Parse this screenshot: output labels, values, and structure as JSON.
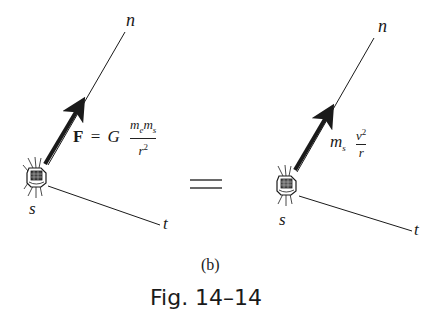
{
  "figure": {
    "panel_label": "(b)",
    "caption": "Fig. 14–14",
    "equals_sign": "="
  },
  "left_diagram": {
    "axis_n_label": "n",
    "axis_t_label": "t",
    "satellite_label": "s",
    "force_label": "F",
    "equation_eq": "=",
    "equation_G": "G",
    "numerator_m1": "m",
    "numerator_m1_sub": "e",
    "numerator_m2": "m",
    "numerator_m2_sub": "s",
    "denominator": "r",
    "denominator_exp": "2"
  },
  "right_diagram": {
    "axis_n_label": "n",
    "axis_t_label": "t",
    "satellite_label": "s",
    "mass": "m",
    "mass_sub": "s",
    "numerator": "v",
    "numerator_exp": "2",
    "denominator": "r"
  },
  "colors": {
    "ink": "#1a1a1a",
    "background": "#ffffff"
  }
}
